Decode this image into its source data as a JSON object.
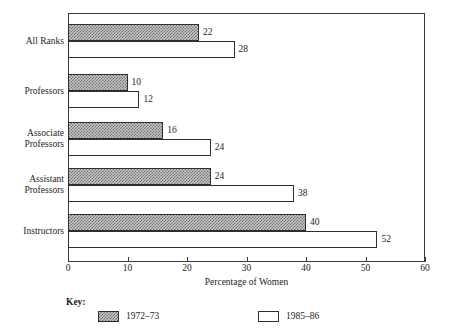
{
  "chart_data": {
    "type": "bar",
    "orientation": "horizontal",
    "title": "",
    "xlabel": "Percentage of Women",
    "ylabel": "",
    "xlim": [
      0,
      60
    ],
    "xticks": [
      0,
      10,
      20,
      30,
      40,
      50,
      60
    ],
    "xtick_labels": [
      "0",
      "10",
      "20",
      "30",
      "40",
      "50",
      "60"
    ],
    "grid": false,
    "legend_position": "below",
    "legend_title": "Key:",
    "categories": [
      "All Ranks",
      "Professors",
      "Associate Professors",
      "Assistant Professors",
      "Instructors"
    ],
    "category_label_lines": [
      [
        "All Ranks"
      ],
      [
        "Professors"
      ],
      [
        "Associate",
        "Professors"
      ],
      [
        "Assistant",
        "Professors"
      ],
      [
        "Instructors"
      ]
    ],
    "series": [
      {
        "name": "1972–73",
        "pattern": "crosshatch-gray",
        "values": [
          22,
          10,
          16,
          24,
          40
        ],
        "value_labels": [
          "22",
          "10",
          "16",
          "24",
          "40"
        ]
      },
      {
        "name": "1985–86",
        "pattern": "speckle-white",
        "values": [
          28,
          12,
          24,
          38,
          52
        ],
        "value_labels": [
          "28",
          "12",
          "24",
          "38",
          "52"
        ]
      }
    ]
  },
  "legend": {
    "title": "Key:",
    "entries": [
      {
        "label": "1972–73",
        "pattern": "crosshatch-gray"
      },
      {
        "label": "1985–86",
        "pattern": "speckle-white"
      }
    ]
  },
  "axis": {
    "x_title": "Percentage of Women",
    "tick_labels": [
      "0",
      "10",
      "20",
      "30",
      "40",
      "50",
      "60"
    ]
  },
  "colors": {
    "bar_fill_1972": "#c9c9c9",
    "bar_fill_1985": "#ffffff",
    "outline": "#2e2e2e",
    "text": "#231f20",
    "background": "#ffffff"
  }
}
